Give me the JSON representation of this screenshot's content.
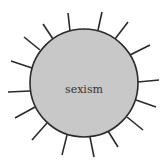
{
  "diagram": {
    "center_label": "sexism",
    "circle": {
      "cx": 84,
      "cy": 83,
      "r": 54,
      "fill": "#c8c8c8",
      "stroke": "#2a2a2a"
    },
    "ray_color": "#2a2a2a",
    "rays": [
      {
        "x1": 70,
        "y1": 31,
        "x2": 68,
        "y2": 13
      },
      {
        "x1": 98,
        "y1": 30,
        "x2": 102,
        "y2": 12
      },
      {
        "x1": 115,
        "y1": 39,
        "x2": 128,
        "y2": 22
      },
      {
        "x1": 130,
        "y1": 55,
        "x2": 150,
        "y2": 45
      },
      {
        "x1": 138,
        "y1": 82,
        "x2": 159,
        "y2": 80
      },
      {
        "x1": 136,
        "y1": 100,
        "x2": 156,
        "y2": 107
      },
      {
        "x1": 127,
        "y1": 117,
        "x2": 143,
        "y2": 130
      },
      {
        "x1": 108,
        "y1": 131,
        "x2": 118,
        "y2": 147
      },
      {
        "x1": 90,
        "y1": 137,
        "x2": 94,
        "y2": 157
      },
      {
        "x1": 67,
        "y1": 135,
        "x2": 62,
        "y2": 155
      },
      {
        "x1": 47,
        "y1": 123,
        "x2": 32,
        "y2": 140
      },
      {
        "x1": 35,
        "y1": 107,
        "x2": 15,
        "y2": 118
      },
      {
        "x1": 30,
        "y1": 91,
        "x2": 8,
        "y2": 92
      },
      {
        "x1": 32,
        "y1": 68,
        "x2": 11,
        "y2": 61
      },
      {
        "x1": 40,
        "y1": 50,
        "x2": 24,
        "y2": 37
      },
      {
        "x1": 53,
        "y1": 39,
        "x2": 43,
        "y2": 24
      }
    ]
  }
}
